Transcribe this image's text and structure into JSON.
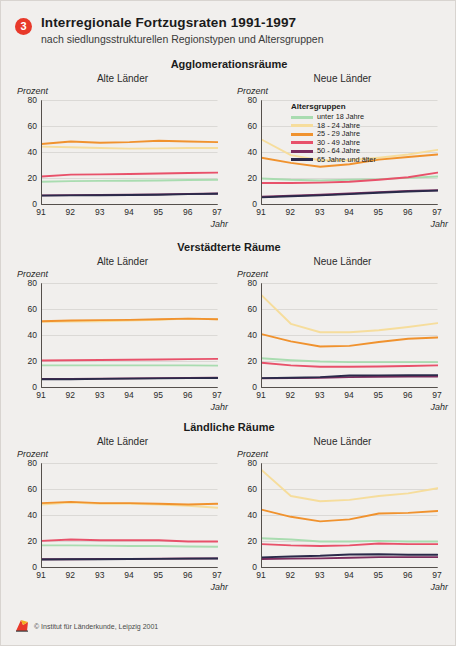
{
  "header": {
    "badge": "3",
    "title": "Interregionale Fortzugsraten 1991-1997",
    "subtitle": "nach siedlungsstrukturellen Regionstypen und Altersgruppen"
  },
  "legend": {
    "title": "Altersgruppen",
    "items": [
      {
        "label": "unter 18 Jahre",
        "color": "#a9dcb0"
      },
      {
        "label": "18 - 24 Jahre",
        "color": "#f6dd9c"
      },
      {
        "label": "25 - 29 Jahre",
        "color": "#f0922e"
      },
      {
        "label": "30 - 49 Jahre",
        "color": "#e8516a"
      },
      {
        "label": "50 - 64 Jahre",
        "color": "#7b2d5e"
      },
      {
        "label": "65 Jahre und älter",
        "color": "#2a2a4a"
      }
    ]
  },
  "footer": {
    "text": "© Institut für Länderkunde, Leipzig 2001"
  },
  "axes": {
    "ylabel": "Prozent",
    "xlabel": "Jahr",
    "yticks": [
      "0",
      "20",
      "40",
      "60",
      "80"
    ],
    "xticks": [
      "91",
      "92",
      "93",
      "94",
      "95",
      "96",
      "97"
    ],
    "ylim": [
      0,
      80
    ],
    "x": [
      1991,
      1992,
      1993,
      1994,
      1995,
      1996,
      1997
    ]
  },
  "panel_titles": {
    "left": "Alte Länder",
    "right": "Neue Länder"
  },
  "sections": [
    {
      "title": "Agglomerationsräume"
    },
    {
      "title": "Verstädterte Räume"
    },
    {
      "title": "Ländliche Räume"
    }
  ],
  "chart_data": [
    {
      "type": "line",
      "title": "Agglomerationsräume",
      "subtitle": "Alte Länder",
      "xlabel": "Jahr",
      "ylabel": "Prozent",
      "ylim": [
        0,
        80
      ],
      "grid": true,
      "legend_position": "none",
      "x": [
        "91",
        "92",
        "93",
        "94",
        "95",
        "96",
        "97"
      ],
      "series": [
        {
          "name": "unter 18 Jahre",
          "color": "#a9dcb0",
          "values": [
            17.5,
            18.0,
            18.2,
            18.3,
            18.5,
            18.8,
            19.0
          ]
        },
        {
          "name": "18 - 24 Jahre",
          "color": "#f6dd9c",
          "values": [
            44.5,
            44.0,
            43.5,
            43.0,
            43.2,
            43.5,
            43.5
          ]
        },
        {
          "name": "25 - 29 Jahre",
          "color": "#f0922e",
          "values": [
            46.5,
            48.5,
            47.5,
            48.0,
            49.0,
            48.5,
            48.0
          ]
        },
        {
          "name": "30 - 49 Jahre",
          "color": "#e8516a",
          "values": [
            21.5,
            23.0,
            23.2,
            23.5,
            23.8,
            24.2,
            24.5
          ]
        },
        {
          "name": "50 - 64 Jahre",
          "color": "#7b2d5e",
          "values": [
            7.0,
            7.2,
            7.3,
            7.5,
            7.8,
            8.2,
            8.5
          ]
        },
        {
          "name": "65 Jahre und älter",
          "color": "#2a2a4a",
          "values": [
            6.8,
            7.0,
            7.1,
            7.3,
            7.5,
            8.0,
            8.3
          ]
        }
      ]
    },
    {
      "type": "line",
      "title": "Agglomerationsräume",
      "subtitle": "Neue Länder",
      "xlabel": "Jahr",
      "ylabel": "Prozent",
      "ylim": [
        0,
        80
      ],
      "grid": true,
      "legend_position": "inside-top",
      "x": [
        "91",
        "92",
        "93",
        "94",
        "95",
        "96",
        "97"
      ],
      "series": [
        {
          "name": "unter 18 Jahre",
          "color": "#a9dcb0",
          "values": [
            20.0,
            19.0,
            18.5,
            19.0,
            19.5,
            20.5,
            21.5
          ]
        },
        {
          "name": "18 - 24 Jahre",
          "color": "#f6dd9c",
          "values": [
            50.0,
            38.0,
            34.0,
            34.0,
            36.0,
            38.5,
            42.0
          ]
        },
        {
          "name": "25 - 29 Jahre",
          "color": "#f0922e",
          "values": [
            36.0,
            32.0,
            29.0,
            31.0,
            34.5,
            36.5,
            38.5
          ]
        },
        {
          "name": "30 - 49 Jahre",
          "color": "#e8516a",
          "values": [
            16.5,
            16.5,
            16.8,
            17.5,
            19.0,
            21.0,
            24.5
          ]
        },
        {
          "name": "50 - 64 Jahre",
          "color": "#7b2d5e",
          "values": [
            6.0,
            6.8,
            7.5,
            8.5,
            9.5,
            10.5,
            11.0
          ]
        },
        {
          "name": "65 Jahre und älter",
          "color": "#2a2a4a",
          "values": [
            5.5,
            6.3,
            7.0,
            8.0,
            9.0,
            10.0,
            10.7
          ]
        }
      ]
    },
    {
      "type": "line",
      "title": "Verstädterte Räume",
      "subtitle": "Alte Länder",
      "xlabel": "Jahr",
      "ylabel": "Prozent",
      "ylim": [
        0,
        80
      ],
      "grid": true,
      "legend_position": "none",
      "x": [
        "91",
        "92",
        "93",
        "94",
        "95",
        "96",
        "97"
      ],
      "series": [
        {
          "name": "unter 18 Jahre",
          "color": "#a9dcb0",
          "values": [
            17.0,
            17.0,
            17.0,
            17.0,
            17.0,
            17.0,
            16.8
          ]
        },
        {
          "name": "18 - 24 Jahre",
          "color": "#f6dd9c",
          "values": [
            50.5,
            50.8,
            51.0,
            51.5,
            52.0,
            53.0,
            52.5
          ]
        },
        {
          "name": "25 - 29 Jahre",
          "color": "#f0922e",
          "values": [
            51.0,
            51.5,
            51.8,
            52.0,
            52.5,
            53.0,
            52.5
          ]
        },
        {
          "name": "30 - 49 Jahre",
          "color": "#e8516a",
          "values": [
            20.8,
            21.0,
            21.2,
            21.3,
            21.5,
            21.8,
            22.0
          ]
        },
        {
          "name": "50 - 64 Jahre",
          "color": "#7b2d5e",
          "values": [
            6.5,
            6.6,
            6.8,
            7.0,
            7.2,
            7.4,
            7.5
          ]
        },
        {
          "name": "65 Jahre und älter",
          "color": "#2a2a4a",
          "values": [
            6.3,
            6.4,
            6.6,
            6.8,
            7.0,
            7.2,
            7.3
          ]
        }
      ]
    },
    {
      "type": "line",
      "title": "Verstädterte Räume",
      "subtitle": "Neue Länder",
      "xlabel": "Jahr",
      "ylabel": "Prozent",
      "ylim": [
        0,
        80
      ],
      "grid": true,
      "legend_position": "none",
      "x": [
        "91",
        "92",
        "93",
        "94",
        "95",
        "96",
        "97"
      ],
      "series": [
        {
          "name": "unter 18 Jahre",
          "color": "#a9dcb0",
          "values": [
            22.5,
            21.0,
            20.0,
            19.5,
            19.5,
            19.5,
            19.5
          ]
        },
        {
          "name": "18 - 24 Jahre",
          "color": "#f6dd9c",
          "values": [
            71.0,
            49.0,
            42.5,
            42.5,
            44.0,
            46.5,
            49.5
          ]
        },
        {
          "name": "25 - 29 Jahre",
          "color": "#f0922e",
          "values": [
            41.0,
            35.5,
            31.5,
            32.0,
            35.0,
            37.5,
            38.5
          ]
        },
        {
          "name": "30 - 49 Jahre",
          "color": "#e8516a",
          "values": [
            19.0,
            17.0,
            16.0,
            16.0,
            16.2,
            16.5,
            17.0
          ]
        },
        {
          "name": "50 - 64 Jahre",
          "color": "#7b2d5e",
          "values": [
            7.0,
            7.2,
            7.5,
            8.0,
            8.3,
            8.5,
            8.5
          ]
        },
        {
          "name": "65 Jahre und älter",
          "color": "#2a2a4a",
          "values": [
            7.2,
            7.5,
            8.0,
            9.2,
            9.3,
            9.4,
            9.5
          ]
        }
      ]
    },
    {
      "type": "line",
      "title": "Ländliche Räume",
      "subtitle": "Alte Länder",
      "xlabel": "Jahr",
      "ylabel": "Prozent",
      "ylim": [
        0,
        80
      ],
      "grid": true,
      "legend_position": "none",
      "x": [
        "91",
        "92",
        "93",
        "94",
        "95",
        "96",
        "97"
      ],
      "series": [
        {
          "name": "unter 18 Jahre",
          "color": "#a9dcb0",
          "values": [
            17.0,
            17.0,
            16.8,
            16.5,
            16.5,
            16.2,
            16.0
          ]
        },
        {
          "name": "18 - 24 Jahre",
          "color": "#f6dd9c",
          "values": [
            48.5,
            50.0,
            49.0,
            49.0,
            48.5,
            47.5,
            46.0
          ]
        },
        {
          "name": "25 - 29 Jahre",
          "color": "#f0922e",
          "values": [
            49.5,
            50.5,
            49.5,
            49.5,
            49.0,
            48.5,
            49.0
          ]
        },
        {
          "name": "30 - 49 Jahre",
          "color": "#e8516a",
          "values": [
            20.5,
            21.5,
            21.0,
            21.0,
            21.0,
            20.0,
            20.0
          ]
        },
        {
          "name": "50 - 64 Jahre",
          "color": "#7b2d5e",
          "values": [
            6.3,
            6.4,
            6.5,
            6.6,
            6.8,
            6.9,
            7.0
          ]
        },
        {
          "name": "65 Jahre und älter",
          "color": "#2a2a4a",
          "values": [
            6.2,
            6.3,
            6.4,
            6.5,
            6.6,
            6.8,
            6.9
          ]
        }
      ]
    },
    {
      "type": "line",
      "title": "Ländliche Räume",
      "subtitle": "Neue Länder",
      "xlabel": "Jahr",
      "ylabel": "Prozent",
      "ylim": [
        0,
        80
      ],
      "grid": true,
      "legend_position": "none",
      "x": [
        "91",
        "92",
        "93",
        "94",
        "95",
        "96",
        "97"
      ],
      "series": [
        {
          "name": "unter 18 Jahre",
          "color": "#a9dcb0",
          "values": [
            22.5,
            21.5,
            20.0,
            20.0,
            20.5,
            20.0,
            20.0
          ]
        },
        {
          "name": "18 - 24 Jahre",
          "color": "#f6dd9c",
          "values": [
            75.0,
            55.0,
            51.0,
            52.0,
            55.0,
            57.0,
            61.0
          ]
        },
        {
          "name": "25 - 29 Jahre",
          "color": "#f0922e",
          "values": [
            44.5,
            39.0,
            35.5,
            37.0,
            41.5,
            42.0,
            43.5
          ]
        },
        {
          "name": "30 - 49 Jahre",
          "color": "#e8516a",
          "values": [
            18.0,
            17.0,
            16.5,
            17.0,
            18.5,
            18.0,
            18.0
          ]
        },
        {
          "name": "50 - 64 Jahre",
          "color": "#7b2d5e",
          "values": [
            6.5,
            6.8,
            7.0,
            7.5,
            8.0,
            8.0,
            8.0
          ]
        },
        {
          "name": "65 Jahre und älter",
          "color": "#2a2a4a",
          "values": [
            7.8,
            8.5,
            9.0,
            10.0,
            10.2,
            9.8,
            9.8
          ]
        }
      ]
    }
  ]
}
